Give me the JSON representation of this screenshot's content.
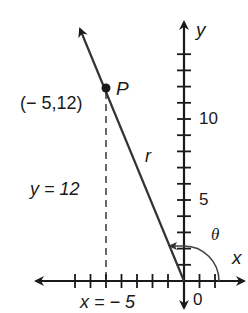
{
  "diagram": {
    "type": "coordinate-plane-angle",
    "axes": {
      "x_label": "x",
      "y_label": "y",
      "origin_label": "0",
      "y_tick_labels": [
        {
          "value": 5,
          "label": "5"
        },
        {
          "value": 10,
          "label": "10"
        }
      ],
      "x_range": [
        -7,
        2
      ],
      "y_range": [
        0,
        14
      ]
    },
    "point": {
      "name": "P",
      "coords_label": "(− 5,12)",
      "x": -5,
      "y": 12
    },
    "ray_label": "r",
    "angle_label": "θ",
    "vertical_dashed_label": "y = 12",
    "horizontal_label": "x = − 5",
    "colors": {
      "ink": "#1a1a1a",
      "background": "#ffffff"
    }
  }
}
